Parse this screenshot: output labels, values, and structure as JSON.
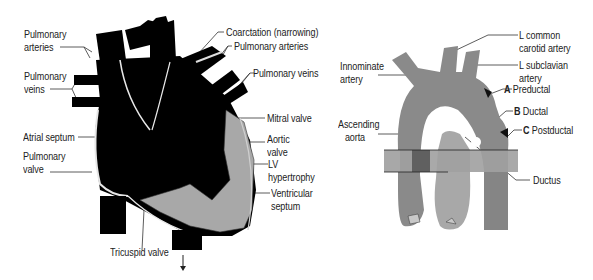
{
  "figure": {
    "left_panel": {
      "subject": "Heart with coarctation of the aorta",
      "labels": {
        "pulmonary_arteries_left": [
          "Pulmonary",
          "arteries"
        ],
        "pulmonary_veins_left": [
          "Pulmonary",
          "veins"
        ],
        "atrial_septum": "Atrial septum",
        "pulmonary_valve": [
          "Pulmonary",
          "valve"
        ],
        "coarctation": "Coarctation (narrowing)",
        "pulmonary_arteries_right": "Pulmonary arteries",
        "pulmonary_veins_right": "Pulmonary veins",
        "mitral_valve": "Mitral valve",
        "aortic_valve": [
          "Aortic",
          "valve"
        ],
        "lv_hypertrophy": [
          "LV",
          "hypertrophy"
        ],
        "ventricular_septum": [
          "Ventricular",
          "septum"
        ],
        "tricuspid_valve": "Tricuspid valve"
      },
      "colors": {
        "heart": "#000000",
        "myocardium": "#a8a8a8",
        "outline": "#e8e8e8"
      }
    },
    "right_panel": {
      "subject": "Aortic arch coarctation sites",
      "labels": {
        "innominate_artery": [
          "Innominate",
          "artery"
        ],
        "ascending_aorta": [
          "Ascending",
          "aorta"
        ],
        "l_common_carotid": [
          "L common",
          "carotid artery"
        ],
        "l_subclavian": [
          "L subclavian",
          "artery"
        ],
        "preductal": {
          "letter": "A",
          "text": "Preductal"
        },
        "ductal": {
          "letter": "B",
          "text": "Ductal"
        },
        "postductal": {
          "letter": "C",
          "text": "Postductal"
        },
        "ductus": "Ductus"
      },
      "colors": {
        "aorta": "#8a8a8a",
        "pulmonary_trunk": "#a5a5a5",
        "band": "#9a9a9a",
        "dark": "#555555"
      }
    }
  }
}
